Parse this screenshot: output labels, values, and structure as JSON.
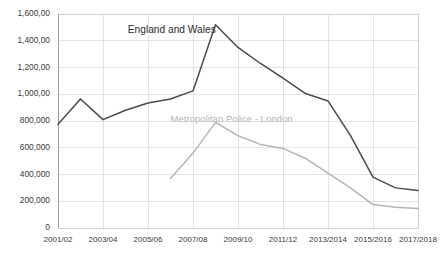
{
  "chart_data": {
    "type": "line",
    "title": "",
    "subtitle": "",
    "xlabel": "",
    "ylabel": "",
    "ylim": [
      0,
      1600000
    ],
    "yticks": [
      0,
      200000,
      400000,
      600000,
      800000,
      1000000,
      1200000,
      1400000,
      1600000
    ],
    "ytick_labels": [
      "0",
      "200,000",
      "400,000",
      "600,000",
      "800,000",
      "1,000,00",
      "1,200,00",
      "1,400,00",
      "1,600,00"
    ],
    "grid": true,
    "legend_position": "inline-annotation",
    "x": [
      "2001/02",
      "2002/03",
      "2003/04",
      "2004/05",
      "2005/06",
      "2006/07",
      "2007/08",
      "2008/09",
      "2009/10",
      "2010/11",
      "2011/12",
      "2012/13",
      "2013/2014",
      "2014/2015",
      "2015/2016",
      "2016/2017",
      "2017/2018"
    ],
    "xtick_labels": [
      "2001/02",
      "2003/04",
      "2005/06",
      "2007/08",
      "2009/10",
      "2011/12",
      "2013/2014",
      "2015/2016",
      "2017/2018"
    ],
    "xtick_indices": [
      0,
      2,
      4,
      6,
      8,
      10,
      12,
      14,
      16
    ],
    "series": [
      {
        "name": "England and Wales",
        "color": "#4a4a4a",
        "stroke_width": 1.5,
        "label_x_index": 3.1,
        "label_y_value": 1480000,
        "values": [
          775000,
          965000,
          810000,
          880000,
          935000,
          965000,
          1025000,
          1520000,
          1350000,
          1230000,
          1120000,
          1005000,
          950000,
          690000,
          380000,
          300000,
          280000
        ]
      },
      {
        "name": "Metropolitan Police - London",
        "color": "#b5b5b5",
        "stroke_width": 1.5,
        "label_x_index": 5.0,
        "label_y_value": 810000,
        "values": [
          null,
          null,
          null,
          null,
          null,
          370000,
          560000,
          790000,
          690000,
          625000,
          595000,
          520000,
          410000,
          300000,
          175000,
          155000,
          145000
        ]
      }
    ]
  },
  "layout": {
    "plot_left": 58,
    "plot_right": 418,
    "plot_top": 14,
    "plot_bottom": 228
  }
}
